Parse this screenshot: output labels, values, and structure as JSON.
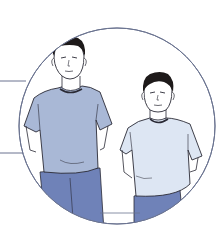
{
  "illustration": {
    "subject": "Two men standing in t-shirts inside a circular callout",
    "figures": [
      {
        "id": "taller-man",
        "shirt_color": "#a9b8d6",
        "pants_color": "#6f82b8",
        "hair_color": "#1e1a1a"
      },
      {
        "id": "shorter-man",
        "shirt_color": "#dde6f3",
        "pants_color": "#6f82b8",
        "hair_color": "#1e1a1a"
      }
    ],
    "circle": {
      "stroke": "#6a7390",
      "fill": "#ffffff"
    },
    "leader_lines": {
      "count": 2,
      "color": "#6a7390"
    },
    "skin_color": "#ffffff",
    "outline_color": "#2a2a35"
  }
}
